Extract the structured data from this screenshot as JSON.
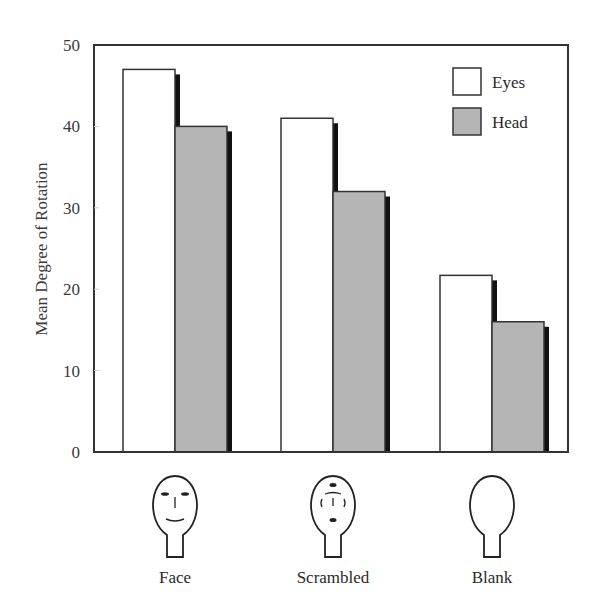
{
  "chart_data": {
    "type": "bar",
    "title": "",
    "xlabel": "",
    "ylabel": "Mean Degree of Rotation",
    "ylim": [
      0,
      50
    ],
    "yticks": [
      0,
      10,
      20,
      30,
      40,
      50
    ],
    "grid": false,
    "legend_position": "upper right",
    "categories": [
      "Face",
      "Scrambled",
      "Blank"
    ],
    "category_icons": [
      "face-head-icon",
      "scrambled-face-head-icon",
      "blank-head-icon"
    ],
    "series": [
      {
        "name": "Eyes",
        "values": [
          47,
          41,
          21.7
        ],
        "color": "#ffffff"
      },
      {
        "name": "Head",
        "values": [
          40,
          32,
          16
        ],
        "color": "#b5b5b5"
      }
    ]
  },
  "style": {
    "shadow_color": "#111111",
    "border_color": "#333333"
  }
}
